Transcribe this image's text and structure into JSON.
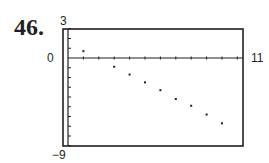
{
  "problem_number": "46.",
  "labels": {
    "ymax": "3",
    "yzero": "0",
    "xmax": "11",
    "ymin": "−9"
  },
  "chart_data": {
    "type": "scatter",
    "title": "",
    "xlabel": "",
    "ylabel": "",
    "xlim": [
      0,
      11
    ],
    "ylim": [
      -9,
      3
    ],
    "x_ticks": [
      1,
      2,
      3,
      4,
      5,
      6,
      7,
      8,
      9,
      10,
      11
    ],
    "y_ticks": [
      3,
      2,
      1,
      -1,
      -2,
      -3,
      -4,
      -5,
      -6,
      -7,
      -8,
      -9
    ],
    "grid": false,
    "x": [
      1,
      3,
      4,
      5,
      6,
      7,
      8,
      9,
      10
    ],
    "y": [
      0.7,
      -0.9,
      -1.7,
      -2.5,
      -3.3,
      -4.2,
      -4.9,
      -5.8,
      -6.7
    ]
  }
}
